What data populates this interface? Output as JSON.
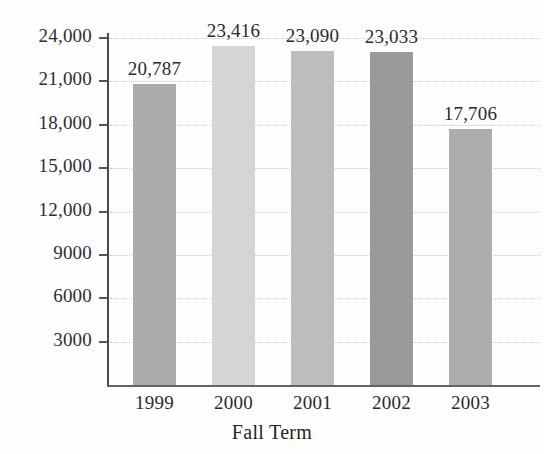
{
  "chart_data": {
    "type": "bar",
    "title": "",
    "xlabel": "Fall Term",
    "ylabel": "",
    "categories": [
      "1999",
      "2000",
      "2001",
      "2002",
      "2003"
    ],
    "values": [
      20787,
      23416,
      23090,
      23033,
      17706
    ],
    "value_labels": [
      "20,787",
      "23,416",
      "23,090",
      "23,033",
      "17,706"
    ],
    "bar_colors": [
      "#ababab",
      "#d5d5d5",
      "#bdbdbd",
      "#9a9a9a",
      "#adadad"
    ],
    "ylim": [
      0,
      24000
    ],
    "yticks": [
      3000,
      6000,
      9000,
      12000,
      15000,
      18000,
      21000,
      24000
    ],
    "ytick_labels": [
      "3000",
      "6000",
      "9000",
      "12,000",
      "15,000",
      "18,000",
      "21,000",
      "24,000"
    ],
    "grid": true,
    "grid_color": "#c9c9c9",
    "legend": null,
    "axis_color": "#4a4a4a",
    "background": "#fefefe"
  }
}
